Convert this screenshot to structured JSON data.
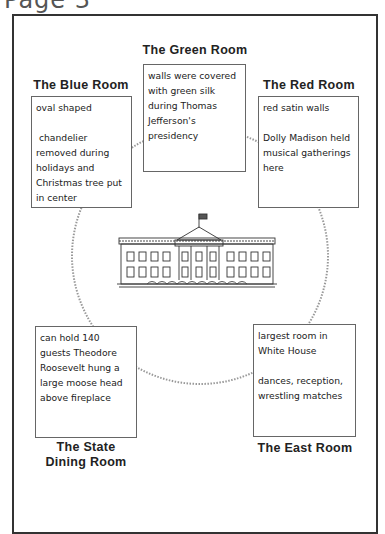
{
  "page": {
    "header": "Page 3"
  },
  "center_image": {
    "icon": "white-house-illustration"
  },
  "rooms": {
    "green": {
      "title": "The Green Room",
      "facts": [
        "walls were covered with green silk during Thomas Jefferson's presidency"
      ]
    },
    "blue": {
      "title": "The Blue Room",
      "facts": [
        "oval shaped",
        "chandelier removed during holidays and Christmas tree put in center"
      ]
    },
    "red": {
      "title": "The Red Room",
      "facts": [
        "red satin walls",
        "Dolly Madison held musical gatherings here"
      ]
    },
    "state_dining": {
      "title_line1": "The State",
      "title_line2": "Dining Room",
      "facts": [
        "can hold 140 guests Theodore Roosevelt hung a large moose head above fireplace"
      ]
    },
    "east": {
      "title": "The East Room",
      "facts": [
        "largest room in White House",
        "dances, reception, wrestling matches"
      ]
    }
  }
}
